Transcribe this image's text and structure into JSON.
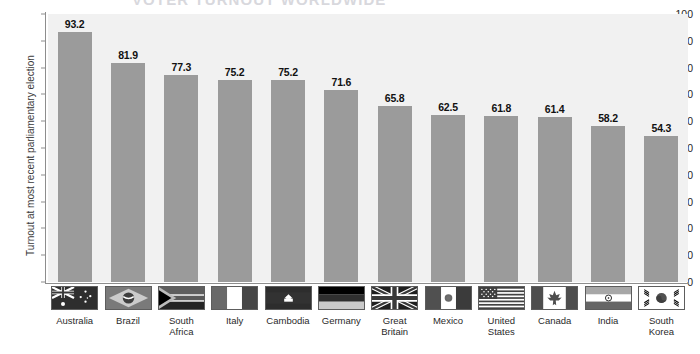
{
  "title": "VOTER TURNOUT WORLDWIDE",
  "chart_data": {
    "type": "bar",
    "title": "VOTER TURNOUT WORLDWIDE",
    "xlabel": "",
    "ylabel": "Turnout at most recent parliamentary election",
    "ylim": [
      0,
      100
    ],
    "yticks": [
      0,
      10,
      20,
      30,
      40,
      50,
      60,
      70,
      80,
      90,
      100
    ],
    "grid": false,
    "legend": "none",
    "bar_color": "#9b9b9b",
    "plot_background": "#f1f1f1",
    "categories": [
      "Australia",
      "Brazil",
      "South Africa",
      "Italy",
      "Cambodia",
      "Germany",
      "Great Britain",
      "Mexico",
      "United States",
      "Canada",
      "India",
      "South Korea"
    ],
    "category_labels": [
      "Australia",
      "Brazil",
      "South\nAfrica",
      "Italy",
      "Cambodia",
      "Germany",
      "Great\nBritain",
      "Mexico",
      "United\nStates",
      "Canada",
      "India",
      "South\nKorea"
    ],
    "values": [
      93.2,
      81.9,
      77.3,
      75.2,
      75.2,
      71.6,
      65.8,
      62.5,
      61.8,
      61.4,
      58.2,
      54.3
    ],
    "value_labels": [
      "93.2",
      "81.9",
      "77.3",
      "75.2",
      "75.2",
      "71.6",
      "65.8",
      "62.5",
      "61.8",
      "61.4",
      "58.2",
      "54.3"
    ],
    "flags": [
      "flag-australia",
      "flag-brazil",
      "flag-south-africa",
      "flag-italy",
      "flag-cambodia",
      "flag-germany",
      "flag-great-britain",
      "flag-mexico",
      "flag-united-states",
      "flag-canada",
      "flag-india",
      "flag-south-korea"
    ]
  }
}
